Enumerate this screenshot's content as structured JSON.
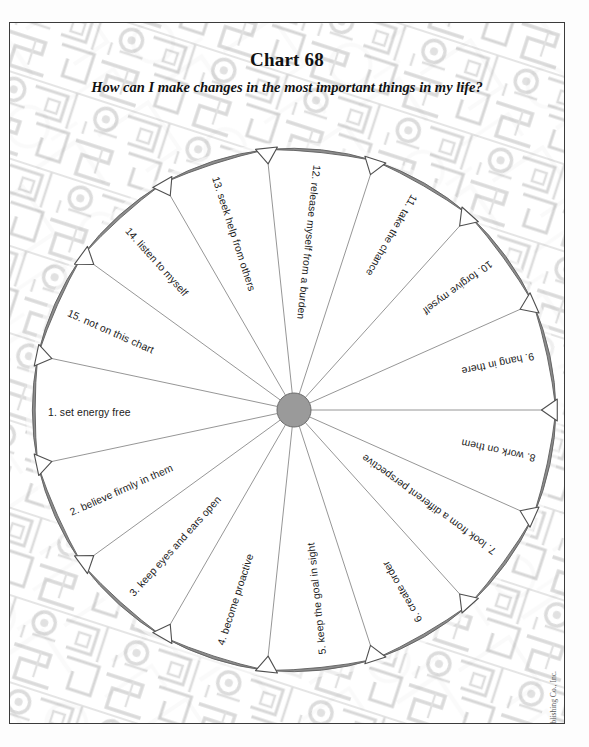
{
  "page": {
    "chart_number_label": "Chart 68",
    "question": "How can I make changes in the most important things in my life?",
    "copyright": "© Sterling Publishing Co., Inc."
  },
  "colors": {
    "rim": "#8d8d8d",
    "rim_stroke": "#5d5d5d",
    "spoke": "#8a8a8a",
    "hub": "#9a9a9a",
    "hub_stroke": "#6d6d6d",
    "text": "#1b1b1b",
    "frame": "#3b3b3b",
    "texture": "#cfcfcf"
  },
  "chart_data": {
    "type": "pie",
    "title": "Chart 68",
    "subtitle": "How can I make changes in the most important things in my life?",
    "slice_count": 15,
    "equal_slices": true,
    "slice_degrees": 24,
    "legend": "none",
    "grid": false,
    "categories": [
      "1.  set energy free",
      "2.  believe firmly in them",
      "3.  keep eyes and ears open",
      "4.  become proactive",
      "5.  keep the goal in sight",
      "6.  create order",
      "7.  look from a different perspective",
      "8.  work on them",
      "9.  hang in there",
      "10.  forgive myself",
      "11.  take the chance",
      "12.  release myself from a burden",
      "13.  seek help from others",
      "14.  listen to myself",
      "15.  not on this chart"
    ],
    "values": [
      1,
      1,
      1,
      1,
      1,
      1,
      1,
      1,
      1,
      1,
      1,
      1,
      1,
      1,
      1
    ]
  },
  "sectors": [
    {
      "n": "1",
      "label": "1.  set energy free"
    },
    {
      "n": "2",
      "label": "2.  believe firmly in them"
    },
    {
      "n": "3",
      "label": "3.  keep eyes and ears open"
    },
    {
      "n": "4",
      "label": "4.  become proactive"
    },
    {
      "n": "5",
      "label": "5.  keep the goal in sight"
    },
    {
      "n": "6",
      "label": "6.  create order"
    },
    {
      "n": "7",
      "label": "7.  look from a different perspective"
    },
    {
      "n": "8",
      "label": "8.  work on them"
    },
    {
      "n": "9",
      "label": "9.  hang in there"
    },
    {
      "n": "10",
      "label": "10.  forgive myself"
    },
    {
      "n": "11",
      "label": "11.  take the chance"
    },
    {
      "n": "12",
      "label": "12.  release myself from a burden"
    },
    {
      "n": "13",
      "label": "13.  seek help from others"
    },
    {
      "n": "14",
      "label": "14.  listen to myself"
    },
    {
      "n": "15",
      "label": "15.  not on this chart"
    }
  ]
}
